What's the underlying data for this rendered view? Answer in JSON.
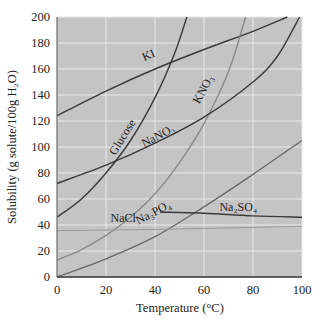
{
  "chart_data": {
    "type": "line",
    "title": "",
    "xlabel": "Temperature (°C)",
    "ylabel": "Solubility (g solute/100g H₂O)",
    "xlim": [
      0,
      100
    ],
    "ylim": [
      0,
      200
    ],
    "xticks": [
      0,
      20,
      40,
      60,
      80,
      100
    ],
    "yticks": [
      0,
      20,
      40,
      60,
      80,
      100,
      120,
      140,
      160,
      180,
      200
    ],
    "grid": true,
    "legend": "none (inline curve labels)",
    "series": [
      {
        "name": "KI",
        "label": "KI",
        "color": "#3a3a3a",
        "points": [
          [
            0,
            124
          ],
          [
            20,
            143
          ],
          [
            40,
            160
          ],
          [
            60,
            175
          ],
          [
            80,
            189
          ],
          [
            94,
            200
          ]
        ],
        "label_pos": [
          38,
          168
        ],
        "label_rot": -24
      },
      {
        "name": "Glucose",
        "label": "Glucose",
        "color": "#3a3a3a",
        "points": [
          [
            0,
            46
          ],
          [
            10,
            60
          ],
          [
            20,
            80
          ],
          [
            30,
            105
          ],
          [
            40,
            138
          ],
          [
            48,
            172
          ],
          [
            53,
            200
          ]
        ],
        "label_pos": [
          28,
          106
        ],
        "label_rot": -58
      },
      {
        "name": "KNO3",
        "label": "KNO₃",
        "color": "#8a8a8a",
        "points": [
          [
            0,
            13
          ],
          [
            10,
            21
          ],
          [
            20,
            32
          ],
          [
            30,
            46
          ],
          [
            40,
            64
          ],
          [
            50,
            88
          ],
          [
            60,
            118
          ],
          [
            70,
            158
          ],
          [
            77,
            200
          ]
        ],
        "label_pos": [
          61,
          143
        ],
        "label_rot": -62
      },
      {
        "name": "NaNO3",
        "label": "NaNO₃",
        "color": "#3a3a3a",
        "points": [
          [
            0,
            72
          ],
          [
            20,
            86
          ],
          [
            40,
            103
          ],
          [
            60,
            123
          ],
          [
            80,
            150
          ],
          [
            90,
            170
          ],
          [
            99,
            200
          ]
        ],
        "label_pos": [
          42,
          106
        ],
        "label_rot": -28
      },
      {
        "name": "Na3PO4",
        "label": "Na₃PO₄",
        "color": "#6a6a6a",
        "points": [
          [
            0,
            0
          ],
          [
            20,
            14
          ],
          [
            40,
            31
          ],
          [
            60,
            54
          ],
          [
            80,
            79
          ],
          [
            100,
            105
          ]
        ],
        "label_pos": [
          40,
          47
        ],
        "label_rot": -28
      },
      {
        "name": "Na2SO4",
        "label": "Na₂SO₄",
        "color": "#3a3a3a",
        "points": [
          [
            42,
            50
          ],
          [
            60,
            49
          ],
          [
            80,
            47
          ],
          [
            100,
            46
          ]
        ],
        "label_pos": [
          74,
          51
        ],
        "label_rot": 0
      },
      {
        "name": "NaCl",
        "label": "NaCl",
        "color": "#9a9a9a",
        "points": [
          [
            0,
            35.7
          ],
          [
            40,
            36.6
          ],
          [
            100,
            39
          ]
        ],
        "label_pos": [
          27,
          42
        ],
        "label_rot": 0
      }
    ]
  },
  "layout": {
    "plot_left": 57,
    "plot_top": 17,
    "plot_right": 302,
    "plot_bottom": 277,
    "plot_bg": "#c4c4c4",
    "grid_color": "#e9e9e9"
  }
}
